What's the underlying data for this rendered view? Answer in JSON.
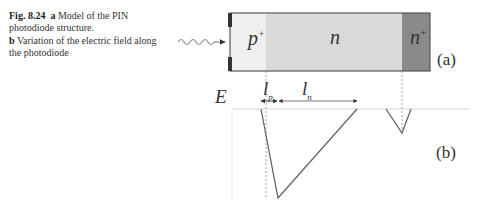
{
  "caption": {
    "fig_label": "Fig. 8.24",
    "part_a_letter": "a",
    "part_a_text": "Model of the PIN photodiode structure.",
    "part_b_letter": "b",
    "part_b_text": "Variation of the electric field along the photodiode"
  },
  "figure": {
    "panel_a": {
      "label": "(a)",
      "regions": [
        {
          "name": "p+",
          "base": "p",
          "sup": "+",
          "color": "#efefef"
        },
        {
          "name": "n",
          "base": "n",
          "sup": "",
          "color": "#d9d9d9"
        },
        {
          "name": "n+",
          "base": "n",
          "sup": "+",
          "color": "#8a8a8a"
        }
      ],
      "incident_light": "wavy-arrow"
    },
    "panel_b": {
      "label": "(b)",
      "y_axis_label": "E",
      "dimension_labels": [
        {
          "base": "l",
          "sub": "p"
        },
        {
          "base": "l",
          "sub": "n"
        }
      ]
    }
  }
}
